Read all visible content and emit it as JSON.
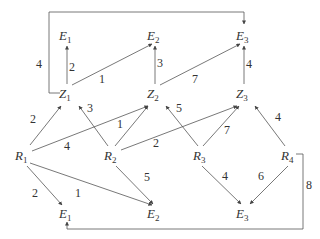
{
  "diagram": {
    "nodes": [
      {
        "id": "E1_top",
        "letter": "E",
        "sub": "1",
        "x": 63,
        "y": 36
      },
      {
        "id": "E2_top",
        "letter": "E",
        "sub": "2",
        "x": 151,
        "y": 36
      },
      {
        "id": "E3_top",
        "letter": "E",
        "sub": "3",
        "x": 240,
        "y": 36
      },
      {
        "id": "Z1",
        "letter": "Z",
        "sub": "1",
        "x": 63,
        "y": 96
      },
      {
        "id": "Z2",
        "letter": "Z",
        "sub": "2",
        "x": 151,
        "y": 96
      },
      {
        "id": "Z3",
        "letter": "Z",
        "sub": "3",
        "x": 240,
        "y": 96
      },
      {
        "id": "R1",
        "letter": "R",
        "sub": "1",
        "x": 19,
        "y": 156
      },
      {
        "id": "R2",
        "letter": "R",
        "sub": "2",
        "x": 111,
        "y": 156
      },
      {
        "id": "R3",
        "letter": "R",
        "sub": "3",
        "x": 199,
        "y": 156
      },
      {
        "id": "R4",
        "letter": "R",
        "sub": "4",
        "x": 286,
        "y": 156
      },
      {
        "id": "E1_bot",
        "letter": "E",
        "sub": "1",
        "x": 63,
        "y": 216
      },
      {
        "id": "E2_bot",
        "letter": "E",
        "sub": "2",
        "x": 151,
        "y": 216
      },
      {
        "id": "E3_bot",
        "letter": "E",
        "sub": "3",
        "x": 240,
        "y": 216
      }
    ],
    "edge_weights": {
      "Z1_E1": "2",
      "Z1_E2": "1",
      "Z1_E3_loop": "4",
      "Z2_E2": "3",
      "Z2_E3": "7",
      "Z3_E3": "4",
      "R1_Z1": "2",
      "R1_Z2": "4",
      "R2_Z1": "3",
      "R2_Z2": "1",
      "R2_Z3": "2",
      "R3_Z2": "5",
      "R3_Z3": "7",
      "R4_Z3": "4",
      "R1_E1": "2",
      "R1_E2": "1",
      "R2_E2": "5",
      "R3_E3": "4",
      "R4_E3": "6",
      "R4_E1_loop": "8"
    }
  }
}
